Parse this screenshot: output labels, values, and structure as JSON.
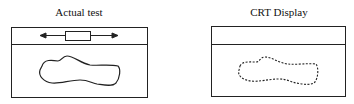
{
  "panels": [
    {
      "title": "Actual test",
      "outline_style": "solid",
      "has_slider": true
    },
    {
      "title": "CRT Display",
      "outline_style": "dashed",
      "has_slider": false
    }
  ],
  "colors": {
    "stroke": "#222222",
    "background": "#ffffff"
  }
}
